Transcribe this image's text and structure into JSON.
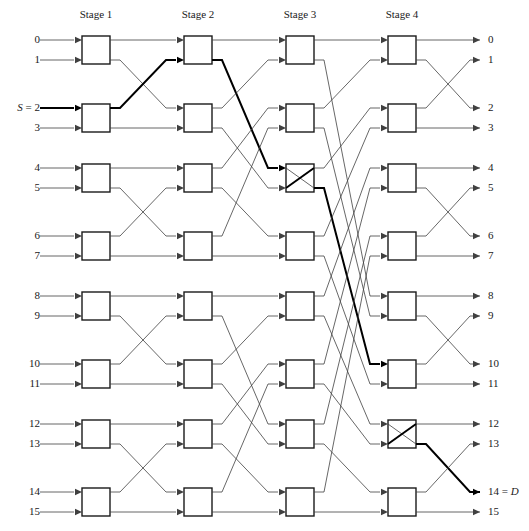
{
  "diagram": {
    "type": "switching-network",
    "num_inputs": 16,
    "num_outputs": 16,
    "num_stages": 4,
    "switches_per_stage": 8,
    "switch_size": "2x2",
    "line_color": "#404040",
    "bold_color": "#000000",
    "box_color": "#1a1a1a",
    "text_color": "#1a1a1a"
  },
  "stages": [
    {
      "label": "Stage 1",
      "x": 96
    },
    {
      "label": "Stage 2",
      "x": 198
    },
    {
      "label": "Stage 3",
      "x": 300
    },
    {
      "label": "Stage 4",
      "x": 402
    }
  ],
  "inputs": [
    {
      "label": "0",
      "row": 0
    },
    {
      "label": "1",
      "row": 1
    },
    {
      "label": "S = 2",
      "row": 2,
      "source": true
    },
    {
      "label": "3",
      "row": 3
    },
    {
      "label": "4",
      "row": 4
    },
    {
      "label": "5",
      "row": 5
    },
    {
      "label": "6",
      "row": 6
    },
    {
      "label": "7",
      "row": 7
    },
    {
      "label": "8",
      "row": 8
    },
    {
      "label": "9",
      "row": 9
    },
    {
      "label": "10",
      "row": 10
    },
    {
      "label": "11",
      "row": 11
    },
    {
      "label": "12",
      "row": 12
    },
    {
      "label": "13",
      "row": 13
    },
    {
      "label": "14",
      "row": 14
    },
    {
      "label": "15",
      "row": 15
    }
  ],
  "outputs": [
    {
      "label": "0",
      "row": 0
    },
    {
      "label": "1",
      "row": 1
    },
    {
      "label": "2",
      "row": 2
    },
    {
      "label": "3",
      "row": 3
    },
    {
      "label": "4",
      "row": 4
    },
    {
      "label": "5",
      "row": 5
    },
    {
      "label": "6",
      "row": 6
    },
    {
      "label": "7",
      "row": 7
    },
    {
      "label": "8",
      "row": 8
    },
    {
      "label": "9",
      "row": 9
    },
    {
      "label": "10",
      "row": 10
    },
    {
      "label": "11",
      "row": 11
    },
    {
      "label": "12",
      "row": 12
    },
    {
      "label": "13",
      "row": 13
    },
    {
      "label": "14 = D",
      "row": 14,
      "destination": true
    },
    {
      "label": "15",
      "row": 15
    }
  ],
  "route": {
    "source": 2,
    "destination": 14,
    "source_label": "S = 2",
    "destination_label": "14 = D",
    "crossed_switches": [
      {
        "stage": 3,
        "switch_index": 2
      },
      {
        "stage": 4,
        "switch_index": 6
      }
    ],
    "path_rows": [
      2,
      1,
      5,
      13,
      14
    ]
  }
}
